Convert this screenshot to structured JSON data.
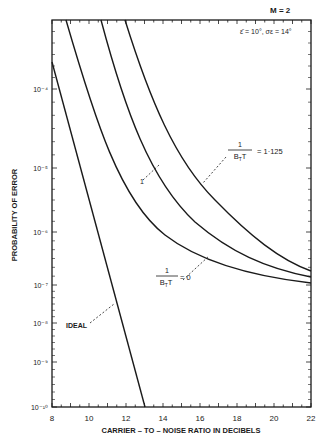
{
  "header": {
    "m_label": "M = 2",
    "params_label": "ε̄ = 10°, σε = 14°"
  },
  "axes": {
    "xlabel": "CARRIER – TO – NOISE RATIO IN DECIBELS",
    "ylabel": "PROBABILITY OF ERROR",
    "xticks": [
      "8",
      "10",
      "12",
      "14",
      "16",
      "18",
      "20",
      "22"
    ],
    "yticks": [
      {
        "label": "10⁻⁴",
        "y": 89
      },
      {
        "label": "10⁻⁵",
        "y": 168
      },
      {
        "label": "10⁻⁶",
        "y": 232
      },
      {
        "label": "10⁻⁷",
        "y": 285
      },
      {
        "label": "10⁻⁸",
        "y": 323
      },
      {
        "label": "10⁻⁹",
        "y": 362
      },
      {
        "label": "10⁻¹⁰",
        "y": 407
      }
    ]
  },
  "annotations": {
    "top": "1/(B_T T) = 1·125",
    "bottom": "1/(B_T T) = 0",
    "ideal": "IDEAL",
    "mid": "1"
  },
  "chart_data": {
    "type": "line",
    "xlabel": "CARRIER-TO-NOISE RATIO IN DECIBELS",
    "ylabel": "PROBABILITY OF ERROR",
    "xlim": [
      8,
      22
    ],
    "ylim": [
      1e-10,
      0.0005
    ],
    "yscale": "probability (non-uniform log)",
    "series": [
      {
        "name": "IDEAL",
        "x": [
          8,
          10,
          12,
          13
        ],
        "y": [
          0.0002,
          2e-06,
          3e-09,
          1e-10
        ]
      },
      {
        "name": "1/(B_T T) = 0",
        "x": [
          8.8,
          10,
          12,
          14,
          16,
          18,
          20,
          22
        ],
        "y": [
          0.0005,
          6e-05,
          4e-06,
          8e-07,
          3.5e-07,
          2e-07,
          1.5e-07,
          1.2e-07
        ]
      },
      {
        "name": "1/(B_T T) = intermediate",
        "x": [
          10.6,
          12,
          14,
          16,
          18,
          20,
          22
        ],
        "y": [
          0.0005,
          6e-05,
          6e-06,
          1.2e-06,
          4.5e-07,
          2.5e-07,
          1.6e-07
        ]
      },
      {
        "name": "1/(B_T T) = 1.125",
        "x": [
          11.9,
          13,
          14,
          16,
          18,
          20,
          22
        ],
        "y": [
          0.0005,
          9e-05,
          2.5e-05,
          3e-06,
          8e-07,
          3.5e-07,
          2e-07
        ]
      }
    ],
    "grid": false,
    "legend": "inline annotations"
  }
}
